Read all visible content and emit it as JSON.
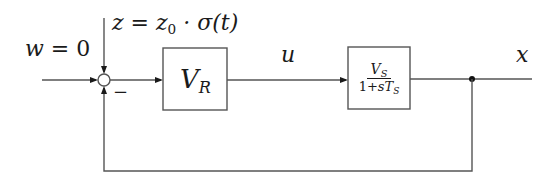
{
  "diagram": {
    "type": "control-loop-block-diagram",
    "signals": {
      "reference": {
        "symbol": "w",
        "equals": "0",
        "text": "w = 0"
      },
      "disturbance": {
        "symbol": "z",
        "expression": "z = z0 · σ(t)",
        "z": "z",
        "eq": " = ",
        "z0_base": "z",
        "z0_sub": "0",
        "rest": " · σ(t)"
      },
      "control": {
        "symbol": "u",
        "text": "u"
      },
      "output": {
        "symbol": "x",
        "text": "x"
      }
    },
    "summing_junction": {
      "inputs": [
        "w (+)",
        "z (+)",
        "x feedback (−)"
      ],
      "minus_sign": "−"
    },
    "blocks": [
      {
        "id": "controller",
        "label": "V_R",
        "base": "V",
        "sub": "R"
      },
      {
        "id": "plant",
        "label": "V_S / (1 + s·T_S)",
        "numerator": {
          "base": "V",
          "sub": "S"
        },
        "denominator": {
          "prefix": "1+",
          "s": "s",
          "base": "T",
          "sub": "S"
        }
      }
    ],
    "feedback": {
      "from": "x",
      "to": "summing_junction",
      "sign": "−"
    },
    "colors": {
      "line": "#555555",
      "text": "#1a1a1a",
      "background": "#ffffff"
    }
  }
}
